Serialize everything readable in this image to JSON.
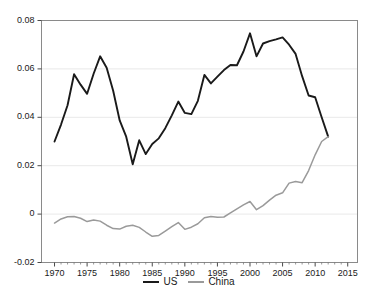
{
  "chart_data": {
    "type": "line",
    "title": "",
    "xlabel": "",
    "ylabel": "",
    "xlim": [
      1968.0,
      2016.5
    ],
    "ylim": [
      -0.02,
      0.08
    ],
    "grid": true,
    "grid_axis": "y",
    "legend_position": "bottom-center",
    "xticks": [
      "1970",
      "1975",
      "1980",
      "1985",
      "1990",
      "1995",
      "2000",
      "2005",
      "2010",
      "2015"
    ],
    "xtick_values": [
      1970,
      1975,
      1980,
      1985,
      1990,
      1995,
      2000,
      2005,
      2010,
      2015
    ],
    "yticks": [
      "0.08",
      "0.06",
      "0.04",
      "0.02",
      "0",
      "-0.02"
    ],
    "ytick_values": [
      0.08,
      0.06,
      0.04,
      0.02,
      0,
      -0.02
    ],
    "x": [
      1970,
      1971,
      1972,
      1973,
      1974,
      1975,
      1976,
      1977,
      1978,
      1979,
      1980,
      1981,
      1982,
      1983,
      1984,
      1985,
      1986,
      1987,
      1988,
      1989,
      1990,
      1991,
      1992,
      1993,
      1994,
      1995,
      1996,
      1997,
      1998,
      1999,
      2000,
      2001,
      2002,
      2003,
      2004,
      2005,
      2006,
      2007,
      2008,
      2009,
      2010,
      2011,
      2012
    ],
    "series": [
      {
        "name": "US",
        "color": "#1a1a1a",
        "values": [
          0.03,
          0.037,
          0.045,
          0.0578,
          0.0535,
          0.0497,
          0.058,
          0.0652,
          0.0605,
          0.051,
          0.0387,
          0.032,
          0.0206,
          0.0305,
          0.0248,
          0.029,
          0.0313,
          0.0355,
          0.0408,
          0.0465,
          0.0418,
          0.0413,
          0.0468,
          0.0575,
          0.054,
          0.0568,
          0.0595,
          0.0616,
          0.0615,
          0.0672,
          0.0747,
          0.0652,
          0.0705,
          0.0715,
          0.0722,
          0.073,
          0.07,
          0.0662,
          0.057,
          0.049,
          0.0483,
          0.04,
          0.032
        ]
      },
      {
        "name": "China",
        "color": "#9a9a9a",
        "values": [
          -0.0037,
          -0.002,
          -0.0011,
          -0.001,
          -0.0017,
          -0.0031,
          -0.0024,
          -0.0029,
          -0.0046,
          -0.006,
          -0.0062,
          -0.005,
          -0.0046,
          -0.0055,
          -0.0074,
          -0.0092,
          -0.0088,
          -0.007,
          -0.0052,
          -0.0035,
          -0.0063,
          -0.0054,
          -0.004,
          -0.0015,
          -0.001,
          -0.0013,
          -0.0012,
          0.0005,
          0.0022,
          0.0038,
          0.0052,
          0.0018,
          0.0035,
          0.0058,
          0.0078,
          0.0088,
          0.0128,
          0.0135,
          0.013,
          0.018,
          0.0245,
          0.03,
          0.032
        ]
      }
    ]
  },
  "legend": {
    "entries": [
      {
        "label": "US"
      },
      {
        "label": "China"
      }
    ]
  }
}
